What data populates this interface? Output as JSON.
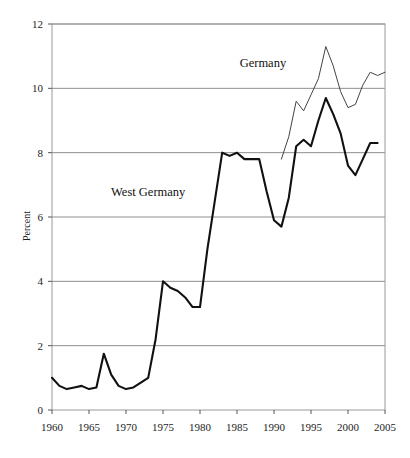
{
  "chart_data": {
    "type": "line",
    "title": "",
    "subtitle": "",
    "xlabel": "",
    "ylabel": "Percent",
    "xlim": [
      1960,
      2005
    ],
    "ylim": [
      0,
      12
    ],
    "xticks": [
      1960,
      1965,
      1970,
      1975,
      1980,
      1985,
      1990,
      1995,
      2000,
      2005
    ],
    "yticks": [
      0,
      2,
      4,
      6,
      8,
      10,
      12
    ],
    "xtick_labels": [
      "1960",
      "1965",
      "1970",
      "1975",
      "1980",
      "1985",
      "1990",
      "1995",
      "2000",
      "2005"
    ],
    "ytick_labels": [
      "0",
      "2",
      "4",
      "6",
      "8",
      "10",
      "12"
    ],
    "grid": "horizontal",
    "legend_position": "inline-annotations",
    "annotations": [
      {
        "text": "Germany",
        "x": 1988.5,
        "y": 10.65
      },
      {
        "text": "West Germany",
        "x": 1973.0,
        "y": 6.65
      }
    ],
    "series": [
      {
        "name": "West Germany",
        "color": "#111111",
        "width": 2.1,
        "x": [
          1960,
          1961,
          1962,
          1963,
          1964,
          1965,
          1966,
          1967,
          1968,
          1969,
          1970,
          1971,
          1972,
          1973,
          1974,
          1975,
          1976,
          1977,
          1978,
          1979,
          1980,
          1981,
          1982,
          1983,
          1984,
          1985,
          1986,
          1987,
          1988,
          1989,
          1990,
          1991,
          1992,
          1993,
          1994,
          1995,
          1996,
          1997,
          1998,
          1999,
          2000,
          2001,
          2002,
          2003,
          2004
        ],
        "y": [
          1.0,
          0.75,
          0.65,
          0.7,
          0.75,
          0.65,
          0.7,
          1.75,
          1.1,
          0.75,
          0.65,
          0.7,
          0.85,
          1.0,
          2.2,
          4.0,
          3.8,
          3.7,
          3.5,
          3.2,
          3.2,
          5.0,
          6.5,
          8.0,
          7.9,
          8.0,
          7.8,
          7.8,
          7.8,
          6.8,
          5.9,
          5.7,
          6.6,
          8.2,
          8.4,
          8.2,
          9.0,
          9.7,
          9.2,
          8.6,
          7.6,
          7.3,
          7.8,
          8.3,
          8.3
        ]
      },
      {
        "name": "Germany",
        "color": "#444444",
        "width": 1.0,
        "x": [
          1991,
          1992,
          1993,
          1994,
          1995,
          1996,
          1997,
          1998,
          1999,
          2000,
          2001,
          2002,
          2003,
          2004,
          2005
        ],
        "y": [
          7.8,
          8.5,
          9.6,
          9.3,
          9.8,
          10.3,
          11.3,
          10.7,
          9.9,
          9.4,
          9.5,
          10.1,
          10.5,
          10.4,
          10.5
        ]
      }
    ]
  },
  "axes": {
    "y_axis_title": "Percent"
  }
}
